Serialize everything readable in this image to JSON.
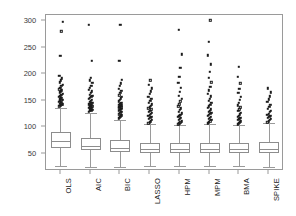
{
  "chart_data": {
    "type": "box",
    "title": "",
    "xlabel": "",
    "ylabel": "",
    "ylim": [
      18,
      312
    ],
    "xlim": [
      0.5,
      8.5
    ],
    "grid": false,
    "legend": "none",
    "y_ticks": [
      50,
      100,
      150,
      200,
      250,
      300
    ],
    "y_tick_labels": [
      "50",
      "100",
      "150",
      "200",
      "250",
      "300"
    ],
    "categories": [
      "OLS",
      "AIC",
      "BIC",
      "LASSO",
      "HPM",
      "MPM",
      "BMA",
      "SPIKE"
    ],
    "boxes": [
      {
        "name": "OLS",
        "min_whisker": 28,
        "q1": 62,
        "median": 74,
        "q3": 92,
        "max_whisker": 137,
        "outliers": [
          140,
          141,
          143,
          144,
          145,
          146,
          147,
          148,
          150,
          151,
          152,
          153,
          155,
          156,
          158,
          160,
          162,
          164,
          166,
          168,
          170,
          172,
          175,
          178,
          181,
          185,
          189,
          193,
          197,
          235,
          281,
          299
        ]
      },
      {
        "name": "AIC",
        "min_whisker": 26,
        "q1": 57,
        "median": 66,
        "q3": 81,
        "max_whisker": 128,
        "outliers": [
          130,
          131,
          132,
          133,
          134,
          135,
          136,
          137,
          138,
          139,
          140,
          141,
          142,
          143,
          144,
          145,
          146,
          147,
          148,
          150,
          152,
          154,
          156,
          158,
          160,
          162,
          165,
          168,
          171,
          175,
          179,
          184,
          189,
          194,
          226,
          294
        ]
      },
      {
        "name": "BIC",
        "min_whisker": 26,
        "q1": 54,
        "median": 61,
        "q3": 76,
        "max_whisker": 115,
        "outliers": [
          117,
          119,
          121,
          123,
          125,
          127,
          129,
          131,
          133,
          134,
          135,
          136,
          137,
          138,
          139,
          140,
          141,
          142,
          143,
          145,
          147,
          149,
          152,
          155,
          158,
          161,
          165,
          169,
          173,
          178,
          183,
          190,
          226,
          294
        ]
      },
      {
        "name": "LASSO",
        "min_whisker": 28,
        "q1": 52,
        "median": 59,
        "q3": 70,
        "max_whisker": 106,
        "outliers": [
          108,
          110,
          112,
          114,
          116,
          118,
          120,
          122,
          124,
          126,
          128,
          130,
          132,
          134,
          136,
          138,
          141,
          144,
          147,
          150,
          154,
          158,
          163,
          168,
          174,
          181,
          189
        ]
      },
      {
        "name": "HPM",
        "min_whisker": 27,
        "q1": 52,
        "median": 59,
        "q3": 70,
        "max_whisker": 104,
        "outliers": [
          106,
          108,
          110,
          112,
          114,
          116,
          118,
          120,
          122,
          124,
          127,
          130,
          133,
          136,
          140,
          144,
          149,
          154,
          160,
          167,
          175,
          184,
          196,
          212,
          238,
          284
        ]
      },
      {
        "name": "MPM",
        "min_whisker": 27,
        "q1": 52,
        "median": 60,
        "q3": 71,
        "max_whisker": 106,
        "outliers": [
          108,
          110,
          112,
          114,
          116,
          118,
          120,
          122,
          124,
          126,
          128,
          130,
          132,
          134,
          137,
          140,
          143,
          146,
          150,
          154,
          159,
          164,
          170,
          177,
          185,
          194,
          205,
          219,
          236,
          262,
          302
        ]
      },
      {
        "name": "BMA",
        "min_whisker": 27,
        "q1": 52,
        "median": 60,
        "q3": 71,
        "max_whisker": 104,
        "outliers": [
          106,
          108,
          110,
          112,
          114,
          116,
          118,
          120,
          122,
          125,
          128,
          131,
          134,
          138,
          142,
          147,
          152,
          158,
          165,
          173,
          183,
          196,
          214
        ]
      },
      {
        "name": "SPIKE",
        "min_whisker": 26,
        "q1": 52,
        "median": 60,
        "q3": 72,
        "max_whisker": 108,
        "outliers": [
          110,
          112,
          114,
          116,
          118,
          120,
          122,
          124,
          126,
          129,
          132,
          135,
          139,
          143,
          148,
          153,
          159,
          166,
          174
        ]
      }
    ],
    "colors": {
      "frame": "#9a9a9a",
      "box_line": "#8d8d8d",
      "whisker": "#9a9a9a",
      "outlier": "#1c1c1c",
      "tick_label": "#3a3a3a",
      "category_label": "#1a1a1a",
      "background": "#ffffff"
    }
  }
}
